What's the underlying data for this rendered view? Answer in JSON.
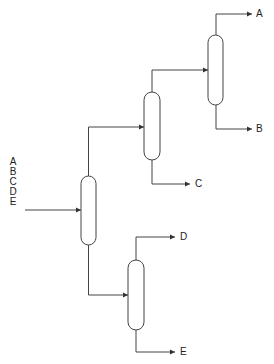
{
  "diagram": {
    "type": "distillation-column-sequence",
    "feed": {
      "components": [
        "A",
        "B",
        "C",
        "D",
        "E"
      ]
    },
    "columns": [
      {
        "id": "col1",
        "feed": "ABCDE",
        "top": "ABC",
        "bottom": "DE"
      },
      {
        "id": "col2",
        "feed": "ABC",
        "top": "AB",
        "bottom": "C"
      },
      {
        "id": "col3",
        "feed": "AB",
        "top": "A",
        "bottom": "B"
      },
      {
        "id": "col4",
        "feed": "DE",
        "top": "D",
        "bottom": "E"
      }
    ],
    "products": {
      "A": "A",
      "B": "B",
      "C": "C",
      "D": "D",
      "E": "E"
    },
    "colors": {
      "line": "#333333",
      "background": "#ffffff"
    }
  }
}
